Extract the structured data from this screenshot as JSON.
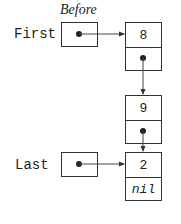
{
  "diagram": {
    "caption": "Before",
    "pointers": [
      {
        "id": "first",
        "label": "First",
        "points_to": "node-8"
      },
      {
        "id": "last",
        "label": "Last",
        "points_to": "node-2"
      }
    ],
    "nodes": [
      {
        "id": "node-8",
        "value": "8",
        "next": "node-9"
      },
      {
        "id": "node-9",
        "value": "9",
        "next": "node-2"
      },
      {
        "id": "node-2",
        "value": "2",
        "next": "nil"
      }
    ],
    "nil_label": "nil",
    "colors": {
      "stroke": "#333333",
      "text": "#222222",
      "background": "#ffffff"
    }
  }
}
